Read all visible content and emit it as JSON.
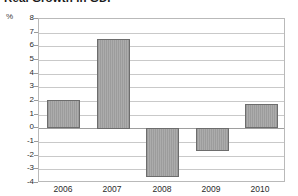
{
  "chart_data": {
    "type": "bar",
    "title": "Real Growth in GDP",
    "xlabel": "",
    "ylabel": "%",
    "categories": [
      "2006",
      "2007",
      "2008",
      "2009",
      "2010"
    ],
    "values": [
      2.05,
      6.55,
      -3.6,
      -1.7,
      1.75
    ],
    "series": [
      {
        "name": "Real Growth in GDP",
        "values": [
          2.05,
          6.55,
          -3.6,
          -1.7,
          1.75
        ]
      }
    ],
    "ylim": [
      -4,
      8
    ],
    "ytick_labels": [
      "8",
      "7",
      "6",
      "5",
      "4",
      "3",
      "2",
      "1",
      "0",
      "-1",
      "-2",
      "-3",
      "-4"
    ],
    "ytick_values": [
      8,
      7,
      6,
      5,
      4,
      3,
      2,
      1,
      0,
      -1,
      -2,
      -3,
      -4
    ],
    "grid": true,
    "legend": false,
    "legend_position": "none",
    "bar_color": "#9c9c9c",
    "bar_border_color": "#6d6d6d",
    "gridline_color": "#c9c9c9",
    "zero_line_color": "#9e9e9e",
    "axis_frame_color": "#b9b9b9"
  }
}
